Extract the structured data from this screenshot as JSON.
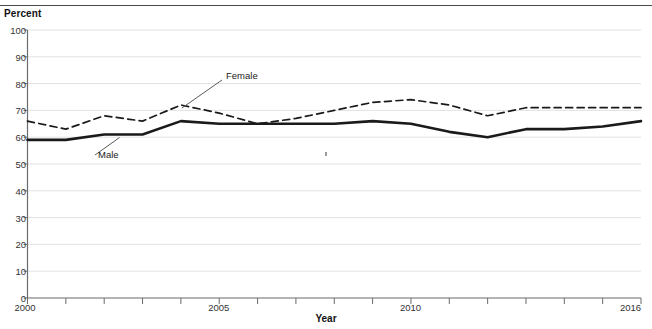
{
  "top_caption": "",
  "axes": {
    "y_title": "Percent",
    "x_title": "Year",
    "y_ticks": [
      "0",
      "10",
      "20",
      "30",
      "40",
      "50",
      "60",
      "70",
      "80",
      "90",
      "100"
    ],
    "x_ticks_labeled": [
      "2000",
      "2005",
      "2010",
      "2016"
    ]
  },
  "annotations": {
    "female": "Female",
    "male": "Male"
  },
  "colors": {
    "line": "#1a1a1a",
    "grid": "#e2e2e2",
    "axis": "#6b6b6b",
    "text": "#111111"
  },
  "chart_data": {
    "type": "line",
    "title": "",
    "subtitle": "",
    "xlabel": "Year",
    "ylabel": "Percent",
    "xlim": [
      2000,
      2016
    ],
    "ylim": [
      0,
      100
    ],
    "ytick_step": 10,
    "grid": true,
    "grid_axis": "y",
    "legend": "inline-annotations",
    "x": [
      2000,
      2001,
      2002,
      2003,
      2004,
      2005,
      2006,
      2007,
      2008,
      2009,
      2010,
      2011,
      2012,
      2013,
      2014,
      2015,
      2016
    ],
    "series": [
      {
        "name": "Female",
        "style": "dashed",
        "values": [
          66,
          63,
          68,
          66,
          72,
          69,
          65,
          67,
          70,
          73,
          74,
          72,
          68,
          71,
          71,
          71,
          71
        ]
      },
      {
        "name": "Male",
        "style": "solid",
        "values": [
          59,
          59,
          61,
          61,
          66,
          65,
          65,
          65,
          65,
          66,
          65,
          62,
          60,
          63,
          63,
          64,
          66
        ]
      }
    ]
  }
}
